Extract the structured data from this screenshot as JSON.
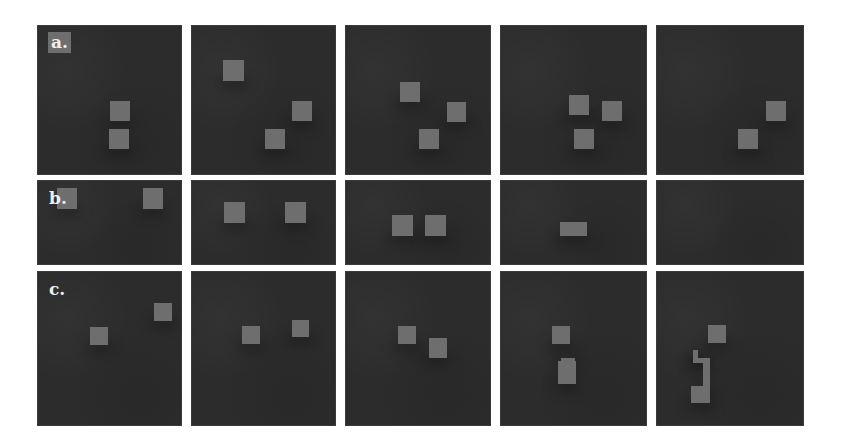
{
  "figure": {
    "background": "#ffffff",
    "panel_color": "#2c2c2c",
    "block_color": "#6e6e6e",
    "rows": [
      {
        "label": "a.",
        "top": 25,
        "height": 150,
        "panels": [
          {
            "blocks": [
              {
                "x": 73,
                "y": 76,
                "w": 20,
                "h": 20
              },
              {
                "x": 72,
                "y": 104,
                "w": 20,
                "h": 20
              }
            ],
            "note": "label overlaps a block at top-left"
          },
          {
            "blocks": [
              {
                "x": 32,
                "y": 35,
                "w": 21,
                "h": 21
              },
              {
                "x": 101,
                "y": 76,
                "w": 20,
                "h": 20
              },
              {
                "x": 74,
                "y": 104,
                "w": 20,
                "h": 20
              }
            ]
          },
          {
            "blocks": [
              {
                "x": 55,
                "y": 57,
                "w": 20,
                "h": 20
              },
              {
                "x": 102,
                "y": 77,
                "w": 19,
                "h": 20
              },
              {
                "x": 74,
                "y": 104,
                "w": 20,
                "h": 20
              }
            ]
          },
          {
            "blocks": [
              {
                "x": 69,
                "y": 70,
                "w": 20,
                "h": 20
              },
              {
                "x": 102,
                "y": 76,
                "w": 20,
                "h": 20
              },
              {
                "x": 74,
                "y": 104,
                "w": 20,
                "h": 20
              }
            ]
          },
          {
            "blocks": [
              {
                "x": 110,
                "y": 76,
                "w": 20,
                "h": 20
              },
              {
                "x": 82,
                "y": 104,
                "w": 20,
                "h": 20
              }
            ]
          }
        ]
      },
      {
        "label": "b.",
        "top": 180,
        "height": 85,
        "panels": [
          {
            "blocks": [
              {
                "x": 20,
                "y": 8,
                "w": 20,
                "h": 21
              },
              {
                "x": 106,
                "y": 8,
                "w": 20,
                "h": 21
              }
            ]
          },
          {
            "blocks": [
              {
                "x": 33,
                "y": 22,
                "w": 21,
                "h": 21
              },
              {
                "x": 94,
                "y": 22,
                "w": 21,
                "h": 21
              }
            ]
          },
          {
            "blocks": [
              {
                "x": 47,
                "y": 35,
                "w": 21,
                "h": 21
              },
              {
                "x": 80,
                "y": 35,
                "w": 21,
                "h": 21
              }
            ]
          },
          {
            "blocks": [
              {
                "x": 60,
                "y": 42,
                "w": 27,
                "h": 14
              }
            ]
          },
          {
            "blocks": []
          }
        ]
      },
      {
        "label": "c.",
        "top": 271,
        "height": 155,
        "panels": [
          {
            "blocks": [
              {
                "x": 53,
                "y": 56,
                "w": 18,
                "h": 18
              },
              {
                "x": 117,
                "y": 32,
                "w": 18,
                "h": 18
              }
            ]
          },
          {
            "blocks": [
              {
                "x": 51,
                "y": 55,
                "w": 18,
                "h": 18
              },
              {
                "x": 101,
                "y": 49,
                "w": 17,
                "h": 17
              }
            ]
          },
          {
            "blocks": [
              {
                "x": 53,
                "y": 55,
                "w": 18,
                "h": 18
              },
              {
                "x": 84,
                "y": 67,
                "w": 18,
                "h": 20
              }
            ]
          },
          {
            "blocks": [
              {
                "x": 52,
                "y": 55,
                "w": 18,
                "h": 18
              },
              {
                "x": 58,
                "y": 90,
                "w": 18,
                "h": 23
              },
              {
                "x": 61,
                "y": 87,
                "w": 14,
                "h": 5
              }
            ]
          },
          {
            "blocks": [
              {
                "x": 52,
                "y": 54,
                "w": 18,
                "h": 18
              },
              {
                "x": 37,
                "y": 79,
                "w": 5,
                "h": 8
              },
              {
                "x": 37,
                "y": 87,
                "w": 17,
                "h": 5
              },
              {
                "x": 47,
                "y": 92,
                "w": 7,
                "h": 26
              },
              {
                "x": 35,
                "y": 115,
                "w": 19,
                "h": 17
              }
            ]
          }
        ]
      }
    ],
    "columns": [
      {
        "left": 37,
        "width": 145
      },
      {
        "left": 191,
        "width": 145
      },
      {
        "left": 345,
        "width": 146
      },
      {
        "left": 500,
        "width": 147
      },
      {
        "left": 656,
        "width": 148
      }
    ]
  }
}
